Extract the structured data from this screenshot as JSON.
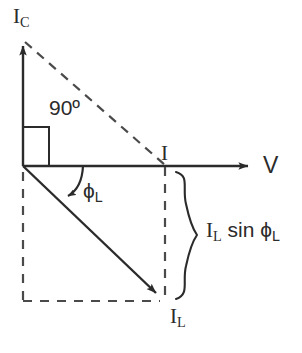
{
  "diagram": {
    "type": "phasor-vector-diagram",
    "background_color": "#ffffff",
    "stroke_color": "#2b2b2b",
    "axes": {
      "vertical": {
        "label": "I",
        "label_subscript": "C",
        "name": "capacitive-current-axis",
        "direction": "up",
        "style": "solid-arrow",
        "origin": [
          23,
          166
        ],
        "tip": [
          23,
          38
        ]
      },
      "horizontal": {
        "label": "V",
        "label_subscript": "",
        "name": "voltage-axis",
        "direction": "right",
        "style": "solid-arrow",
        "origin": [
          23,
          166
        ],
        "tip": [
          257,
          166
        ]
      }
    },
    "vectors": [
      {
        "name": "inductive-current-vector",
        "label": "I",
        "label_subscript": "L",
        "style": "solid-arrow",
        "from": [
          23,
          166
        ],
        "to": [
          163,
          300
        ]
      }
    ],
    "construction_lines": [
      {
        "name": "hypotenuse-dashed-line",
        "style": "dashed",
        "from": [
          23,
          40
        ],
        "to": [
          164,
          166
        ]
      },
      {
        "name": "vertical-projection-dashed-line",
        "style": "dashed",
        "from": [
          165,
          166
        ],
        "to": [
          165,
          301
        ]
      },
      {
        "name": "left-vertical-dashed-line",
        "style": "dashed",
        "from": [
          23,
          172
        ],
        "to": [
          23,
          301
        ]
      },
      {
        "name": "bottom-horizontal-dashed-line",
        "style": "dashed",
        "from": [
          23,
          301
        ],
        "to": [
          163,
          301
        ]
      }
    ],
    "annotations": {
      "right_angle": {
        "label": "90º",
        "name": "right-angle-marker",
        "shape": "square",
        "value_degrees": 90
      },
      "phase_angle": {
        "label": "ϕ",
        "label_subscript": "L",
        "name": "phase-angle-arc",
        "shape": "arc-with-arrow"
      },
      "brace": {
        "name": "projection-brace",
        "label_main": "I",
        "label_sub_1": "L",
        "label_mid": " sin ",
        "label_phi": "ϕ",
        "label_sub_2": "L",
        "full_text": "I_L sin ϕ_L"
      },
      "intersection_point": {
        "label": "I",
        "name": "resultant-current-point"
      }
    }
  }
}
